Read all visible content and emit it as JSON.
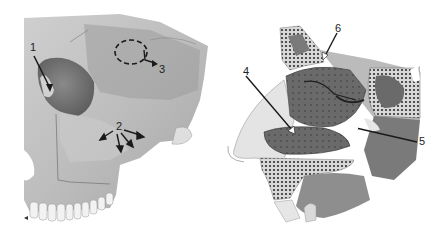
{
  "figure": {
    "panels": [
      {
        "id": "skull",
        "description": "Anterolateral view of skull (frontal, orbit, maxilla, teeth)",
        "labels": [
          {
            "text": "1",
            "x": 30,
            "y": 42,
            "target": "orbit opening"
          },
          {
            "text": "2",
            "x": 116,
            "y": 121,
            "target": "maxilla (multiple arrows)"
          },
          {
            "text": "3",
            "x": 159,
            "y": 64,
            "target": "dashed circle region on frontal bone"
          }
        ]
      },
      {
        "id": "nasal-section",
        "description": "Sagittal section of nasal cavity with conchae and sinuses",
        "labels": [
          {
            "text": "4",
            "x": 243,
            "y": 66,
            "target": "inferior meatus region"
          },
          {
            "text": "5",
            "x": 419,
            "y": 136,
            "target": "posterior opening"
          },
          {
            "text": "6",
            "x": 335,
            "y": 23,
            "target": "cribriform / roof region"
          }
        ]
      }
    ],
    "colors": {
      "background": "#ffffff",
      "bone_light": "#d4d4d4",
      "bone_mid": "#a8a8a8",
      "bone_dark": "#6e6e6e",
      "cavity": "#5a5a5a",
      "spongy": "#3a3a3a",
      "label": "#222222"
    }
  }
}
